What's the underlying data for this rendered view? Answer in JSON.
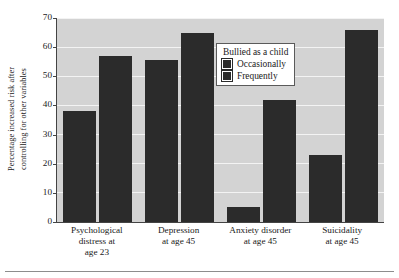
{
  "chart_data": {
    "type": "bar",
    "title": "",
    "subtitle": "",
    "xlabel": "",
    "ylabel": "Percentage increased risk after controlling for other variables",
    "ylabel_lines": [
      "Percentage increased risk after",
      "controlling for other variables"
    ],
    "ylim": [
      0,
      70
    ],
    "yticks": [
      0,
      10,
      20,
      30,
      40,
      50,
      60,
      70
    ],
    "ytick_labels": [
      "0",
      "10",
      "20",
      "30",
      "40",
      "50",
      "60",
      "70"
    ],
    "grid": true,
    "grid_axis": "y",
    "legend_position": "upper center-right",
    "legend_title": "Bullied as a child",
    "categories": [
      "Psychological distress at age 23",
      "Depression at age 45",
      "Anxiety disorder at age 45",
      "Suicidality at age 45"
    ],
    "category_label_lines": [
      [
        "Psychological",
        "distress at",
        "age 23"
      ],
      [
        "Depression",
        "at age 45"
      ],
      [
        "Anxiety disorder",
        "at age 45"
      ],
      [
        "Suicidality",
        "at age 45"
      ]
    ],
    "series": [
      {
        "name": "Occasionally",
        "color": "#2b2b2b",
        "values": [
          38,
          55.5,
          5,
          23
        ]
      },
      {
        "name": "Frequently",
        "color": "#2b2b2b",
        "values": [
          57,
          65,
          42,
          66
        ]
      }
    ],
    "colors": {
      "bar": "#2b2b2b",
      "plot_background": "#d3d3d3",
      "gridline": "#f3f3f3",
      "axis": "#444444",
      "legend_background": "#ffffff",
      "legend_border": "#5a5a5a",
      "text": "#1a1a1a",
      "rule": "#8d8d8d"
    }
  }
}
